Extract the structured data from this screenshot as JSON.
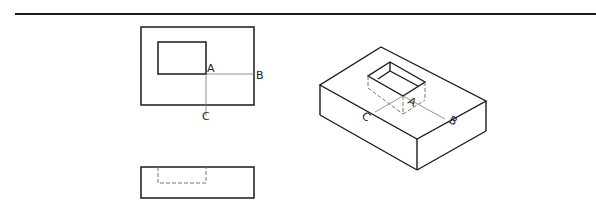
{
  "figure": {
    "type": "orthographic-and-isometric-projection",
    "views": {
      "top_view": {
        "labels": {
          "a": "A",
          "b": "B",
          "c": "C"
        }
      },
      "front_view": {
        "hidden_pocket": true
      },
      "isometric_view": {
        "labels": {
          "a": "A",
          "b": "B",
          "c": "C"
        }
      }
    },
    "colors": {
      "line": "#1a1a1a",
      "thin_line": "#555555",
      "background": "#ffffff"
    }
  }
}
